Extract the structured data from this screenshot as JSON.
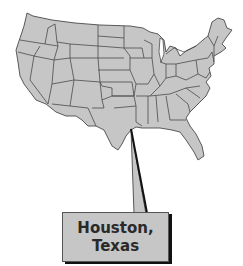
{
  "map": {
    "title": "United States map with callout",
    "fill_color": "#c6c6c6",
    "border_color": "#4a4a4a"
  },
  "callout": {
    "line1": "Houston,",
    "line2": "Texas",
    "fill_color": "#c6c6c6"
  }
}
